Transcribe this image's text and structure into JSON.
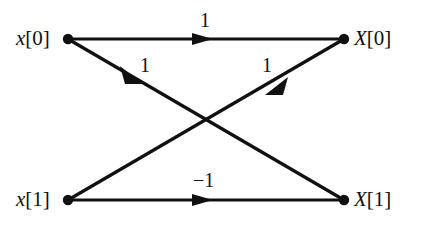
{
  "figure": {
    "type": "signal-flow-graph",
    "title": "",
    "stroke_color": "#111111",
    "background_color": "#ffffff"
  },
  "nodes": [
    {
      "id": "x0",
      "label_sym": "x",
      "label_idx": "[0]",
      "x": 68,
      "y": 39,
      "role": "input"
    },
    {
      "id": "x1",
      "label_sym": "x",
      "label_idx": "[1]",
      "x": 68,
      "y": 200,
      "role": "input"
    },
    {
      "id": "X0",
      "label_sym": "X",
      "label_idx": "[0]",
      "x": 344,
      "y": 39,
      "role": "output"
    },
    {
      "id": "X1",
      "label_sym": "X",
      "label_idx": "[1]",
      "x": 344,
      "y": 200,
      "role": "output"
    }
  ],
  "edges": [
    {
      "id": "e0",
      "from": "x0",
      "to": "X0",
      "gain": "1",
      "arrow_x": 205,
      "arrow_y": 39
    },
    {
      "id": "e1",
      "from": "x0",
      "to": "X1",
      "gain": "1",
      "arrow_x": 136,
      "arrow_y": 79
    },
    {
      "id": "e2",
      "from": "x1",
      "to": "X0",
      "gain": "1",
      "arrow_x": 272,
      "arrow_y": 95
    },
    {
      "id": "e3",
      "from": "x1",
      "to": "X1",
      "gain": "−1",
      "arrow_x": 205,
      "arrow_y": 200
    }
  ]
}
